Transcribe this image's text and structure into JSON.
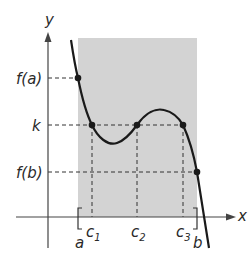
{
  "diagram": {
    "axes": {
      "x_label": "x",
      "y_label": "y"
    },
    "y_labels": {
      "fa": "f(a)",
      "k": "k",
      "fb": "f(b)"
    },
    "x_labels": {
      "a": "a",
      "b": "b",
      "c1": {
        "base": "c",
        "sub": "1"
      },
      "c2": {
        "base": "c",
        "sub": "2"
      },
      "c3": {
        "base": "c",
        "sub": "3"
      }
    },
    "colors": {
      "shade": "#d3d3d3",
      "curve": "#1a1a1a",
      "dash": "#333333",
      "axis": "#444444"
    }
  }
}
